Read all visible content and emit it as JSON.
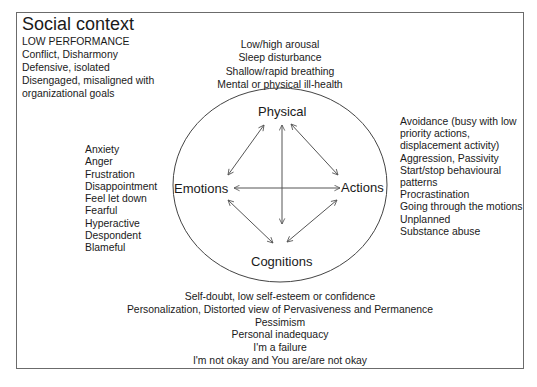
{
  "social_context": {
    "title": "Social context",
    "items": [
      "LOW PERFORMANCE",
      "Conflict, Disharmony",
      "Defensive, isolated",
      "Disengaged, misaligned with",
      "organizational goals"
    ]
  },
  "nodes": {
    "physical": "Physical",
    "emotions": "Emotions",
    "actions": "Actions",
    "cognitions": "Cognitions"
  },
  "physical_items": [
    "Low/high arousal",
    "Sleep disturbance",
    "Shallow/rapid breathing",
    "Mental or physical ill-health"
  ],
  "emotion_items": [
    "Anxiety",
    "Anger",
    "Frustration",
    "Disappointment",
    "Feel let down",
    "Fearful",
    "Hyperactive",
    "Despondent",
    "Blameful"
  ],
  "action_items": [
    "Avoidance (busy with low",
    "priority actions,",
    "displacement activity)",
    "Aggression, Passivity",
    "Start/stop behavioural",
    "patterns",
    "Procrastination",
    "Going through the motions",
    "Unplanned",
    "Substance abuse"
  ],
  "cognition_items": [
    "Self-doubt, low self-esteem or confidence",
    "Personalization, Distorted view of Pervasiveness and Permanence",
    "Pessimism",
    "Personal inadequacy",
    "I'm a failure",
    "I'm not okay and You are/are not okay"
  ],
  "colors": {
    "line": "#555555",
    "text": "#1a1a1a",
    "frame": "#6b6b6b"
  }
}
